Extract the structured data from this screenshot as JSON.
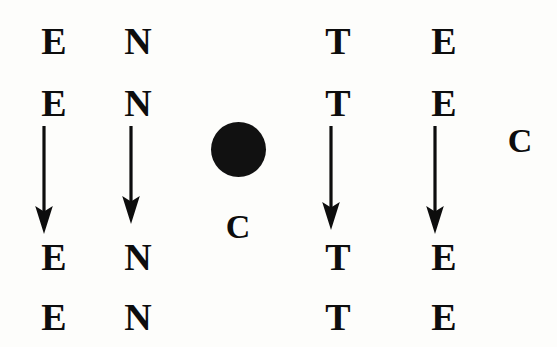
{
  "figure": {
    "type": "letter-column-diagram",
    "background_color": "#fdfdfb",
    "ink_color": "#0d0d0d",
    "columns": [
      {
        "id": "column-1",
        "letter": "E",
        "x": 32,
        "rows": [
          "E",
          "E",
          "E",
          "E"
        ],
        "has_arrow": true
      },
      {
        "id": "column-2",
        "letter": "N",
        "x": 118,
        "rows": [
          "N",
          "N",
          "N",
          "N"
        ],
        "has_arrow": true
      },
      {
        "id": "column-3",
        "letter": "T",
        "x": 317,
        "rows": [
          "T",
          "T",
          "T",
          "T"
        ],
        "has_arrow": true
      },
      {
        "id": "column-4",
        "letter": "E",
        "x": 422,
        "rows": [
          "E",
          "E",
          "E",
          "E"
        ],
        "has_arrow": true
      }
    ],
    "rows_y": [
      22,
      84,
      238,
      298
    ],
    "center": {
      "dot_label": "filled-circle",
      "c_label": "C"
    },
    "right": {
      "c_label": "C"
    }
  },
  "letters": {
    "col1": {
      "r1": "E",
      "r2": "E",
      "r3": "E",
      "r4": "E"
    },
    "col2": {
      "r1": "N",
      "r2": "N",
      "r3": "N",
      "r4": "N"
    },
    "col3": {
      "r1": "T",
      "r2": "T",
      "r3": "T",
      "r4": "T"
    },
    "col4": {
      "r1": "E",
      "r2": "E",
      "r3": "E",
      "r4": "E"
    },
    "center_c": "C",
    "right_c": "C"
  }
}
